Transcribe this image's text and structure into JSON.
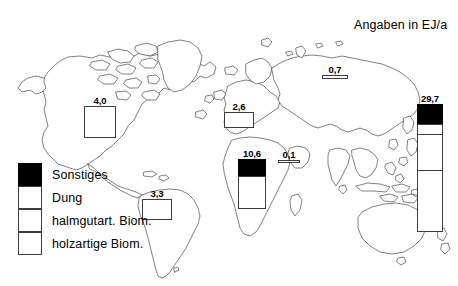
{
  "title": "Angaben in EJ/a",
  "unit": "EJ/a",
  "legend": {
    "items": [
      {
        "key": "sonstiges",
        "label": "Sonstiges",
        "color": "#000000"
      },
      {
        "key": "dung",
        "label": "Dung",
        "color": "#ffffff"
      },
      {
        "key": "halmgutart",
        "label": "halmgutart. Biom.",
        "color": "#ffffff"
      },
      {
        "key": "holzartig",
        "label": "holzartige Biom.",
        "color": "#ffffff"
      }
    ]
  },
  "chart_data": {
    "type": "bar",
    "title": "Angaben in EJ/a",
    "xlabel": "",
    "ylabel": "EJ/a",
    "categories": [
      "Nordamerika",
      "Suedamerika",
      "Europa",
      "Afrika",
      "Naher Osten",
      "Russland / Nordasien",
      "Asien"
    ],
    "values": [
      4.0,
      3.3,
      2.6,
      10.6,
      0.1,
      0.7,
      29.7
    ],
    "value_labels": [
      "4,0",
      "3,3",
      "2,6",
      "10,6",
      "0,1",
      "0,7",
      "29,7"
    ],
    "series": [
      {
        "name": "Sonstiges",
        "values": [
          0.0,
          0.0,
          0.0,
          3.5,
          0.0,
          0.0,
          4.6
        ]
      },
      {
        "name": "Dung",
        "values": [
          0.0,
          0.0,
          0.0,
          0.0,
          0.0,
          0.0,
          2.3
        ]
      },
      {
        "name": "halmgutart. Biom.",
        "values": [
          0.0,
          0.0,
          0.0,
          0.0,
          0.0,
          0.0,
          8.4
        ]
      },
      {
        "name": "holzartige Biom.",
        "values": [
          4.0,
          3.3,
          2.6,
          7.1,
          0.1,
          0.7,
          14.4
        ]
      }
    ],
    "legend_position": "bottom-left",
    "grid": false,
    "ylim": [
      0,
      29.7
    ],
    "annotation": "Angaben in EJ/a"
  },
  "bars": [
    {
      "name": "bar-nordamerika",
      "label": "4,0",
      "x": 84,
      "y": 106,
      "w": 32,
      "h": 32,
      "segments": [
        {
          "key": "holzartig",
          "pct": 100
        }
      ]
    },
    {
      "name": "bar-suedamerika",
      "label": "3,3",
      "x": 142,
      "y": 199,
      "w": 30,
      "h": 21,
      "segments": [
        {
          "key": "holzartig",
          "pct": 100
        }
      ]
    },
    {
      "name": "bar-europa",
      "label": "2,6",
      "x": 224,
      "y": 112,
      "w": 30,
      "h": 16,
      "segments": [
        {
          "key": "holzartig",
          "pct": 100
        }
      ]
    },
    {
      "name": "bar-afrika",
      "label": "10,6",
      "x": 238,
      "y": 159,
      "w": 28,
      "h": 50,
      "segments": [
        {
          "key": "sonstiges",
          "pct": 33
        },
        {
          "key": "holzartig",
          "pct": 67
        }
      ]
    },
    {
      "name": "bar-naher-osten",
      "label": "0,1",
      "x": 278,
      "y": 160,
      "w": 22,
      "h": 3,
      "segments": [
        {
          "key": "holzartig",
          "pct": 100
        }
      ]
    },
    {
      "name": "bar-russland",
      "label": "0,7",
      "x": 322,
      "y": 75,
      "w": 26,
      "h": 4,
      "segments": [
        {
          "key": "holzartig",
          "pct": 100
        }
      ]
    },
    {
      "name": "bar-asien",
      "label": "29,7",
      "x": 417,
      "y": 104,
      "w": 26,
      "h": 128,
      "segments": [
        {
          "key": "sonstiges",
          "pct": 15.5
        },
        {
          "key": "dung",
          "pct": 7.7
        },
        {
          "key": "halmgutart",
          "pct": 28.3
        },
        {
          "key": "holzartig",
          "pct": 48.5
        }
      ]
    }
  ],
  "layout": {
    "title_x": 354,
    "title_y": 18,
    "legend_x": 18,
    "legend_y": 163
  }
}
